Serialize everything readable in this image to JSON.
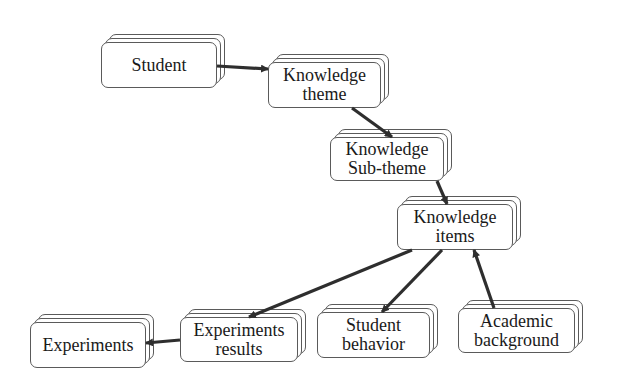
{
  "diagram": {
    "type": "flow",
    "nodes": [
      {
        "id": "student",
        "label": "Student",
        "x": 101,
        "y": 42,
        "w": 116,
        "h": 46
      },
      {
        "id": "knowledge-theme",
        "label": "Knowledge\ntheme",
        "x": 268,
        "y": 62,
        "w": 113,
        "h": 46
      },
      {
        "id": "knowledge-subtheme",
        "label": "Knowledge\nSub-theme",
        "x": 330,
        "y": 137,
        "w": 114,
        "h": 44
      },
      {
        "id": "knowledge-items",
        "label": "Knowledge\nitems",
        "x": 397,
        "y": 204,
        "w": 116,
        "h": 46
      },
      {
        "id": "experiments",
        "label": "Experiments",
        "x": 30,
        "y": 322,
        "w": 116,
        "h": 46
      },
      {
        "id": "experiments-results",
        "label": "Experiments\nresults",
        "x": 180,
        "y": 317,
        "w": 118,
        "h": 45
      },
      {
        "id": "student-behavior",
        "label": "Student\nbehavior",
        "x": 317,
        "y": 312,
        "w": 113,
        "h": 46
      },
      {
        "id": "academic-background",
        "label": "Academic\nbackground",
        "x": 458,
        "y": 308,
        "w": 117,
        "h": 45
      }
    ],
    "edges": [
      {
        "from": "student",
        "to": "knowledge-theme",
        "x1": 217,
        "y1": 66,
        "x2": 268,
        "y2": 69
      },
      {
        "from": "knowledge-theme",
        "to": "knowledge-subtheme",
        "x1": 352,
        "y1": 108,
        "x2": 392,
        "y2": 137
      },
      {
        "from": "knowledge-subtheme",
        "to": "knowledge-items",
        "x1": 437,
        "y1": 181,
        "x2": 447,
        "y2": 204
      },
      {
        "from": "knowledge-items",
        "to": "experiments-results",
        "x1": 412,
        "y1": 250,
        "x2": 249,
        "y2": 317
      },
      {
        "from": "knowledge-items",
        "to": "student-behavior",
        "x1": 442,
        "y1": 250,
        "x2": 382,
        "y2": 312
      },
      {
        "from": "academic-background",
        "to": "knowledge-items",
        "x1": 494,
        "y1": 308,
        "x2": 474,
        "y2": 250
      },
      {
        "from": "experiments-results",
        "to": "experiments",
        "x1": 180,
        "y1": 340,
        "x2": 146,
        "y2": 343
      }
    ]
  }
}
